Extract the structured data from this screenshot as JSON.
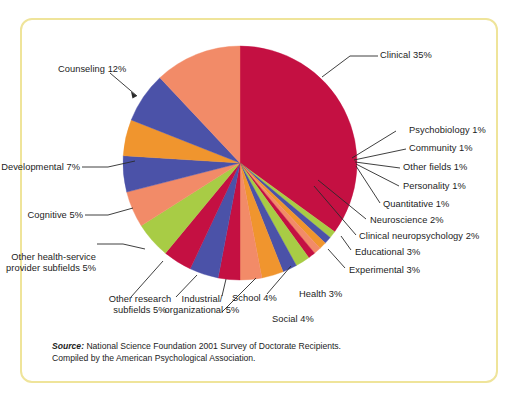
{
  "figure": {
    "border_color": "#EFE49A",
    "background": "#ffffff"
  },
  "source_note": {
    "label": "Source:",
    "line1": " National Science Foundation 2001 Survey of Doctorate Recipients.",
    "line2": "Compiled by the American Psychological Association."
  },
  "chart_data": {
    "type": "pie",
    "title": "",
    "xlabel": "",
    "ylabel": "",
    "legend_position": "callout-labels",
    "grid": false,
    "start_angle_deg": -90,
    "direction": "clockwise",
    "center": {
      "x": 240,
      "y": 163
    },
    "radius": 117,
    "categories": [
      "Clinical",
      "Psychobiology",
      "Community",
      "Other fields",
      "Personality",
      "Quantitative",
      "Neuroscience",
      "Clinical neuropsychology",
      "Educational",
      "Experimental",
      "Health",
      "Social",
      "School",
      "Industrial/organizational",
      "Other research subfields",
      "Other health-service provider subfields",
      "Cognitive",
      "Developmental",
      "Counseling"
    ],
    "values": [
      35,
      1,
      1,
      1,
      1,
      1,
      2,
      2,
      3,
      3,
      3,
      4,
      4,
      5,
      5,
      5,
      5,
      7,
      12
    ],
    "colors": [
      "#C41042",
      "#A8CC45",
      "#4B52A8",
      "#F0952E",
      "#F28B68",
      "#C41042",
      "#A8CC45",
      "#4B52A8",
      "#F0952E",
      "#F28B68",
      "#C41042",
      "#4B52A8",
      "#C41042",
      "#A8CC45",
      "#F28B68",
      "#4B52A8",
      "#F0952E",
      "#4B52A8",
      "#F28B68"
    ],
    "labels": [
      {
        "key": "clinical",
        "text": "Clinical 35%"
      },
      {
        "key": "psychobiology",
        "text": "Psychobiology 1%"
      },
      {
        "key": "community",
        "text": "Community 1%"
      },
      {
        "key": "other-fields",
        "text": "Other fields 1%"
      },
      {
        "key": "personality",
        "text": "Personality 1%"
      },
      {
        "key": "quantitative",
        "text": "Quantitative 1%"
      },
      {
        "key": "neuroscience",
        "text": "Neuroscience 2%"
      },
      {
        "key": "clinical-neuropsychology",
        "text": "Clinical neuropsychology 2%"
      },
      {
        "key": "educational",
        "text": "Educational 3%"
      },
      {
        "key": "experimental",
        "text": "Experimental 3%"
      },
      {
        "key": "health",
        "text": "Health 3%"
      },
      {
        "key": "social",
        "text": "Social 4%"
      },
      {
        "key": "school",
        "text": "School 4%"
      },
      {
        "key": "industrial-organizational",
        "text": "Industrial/\norganizational 5%"
      },
      {
        "key": "other-research-subfields",
        "text": "Other research\nsubfields 5%"
      },
      {
        "key": "other-health-service",
        "text": "Other health-service\nprovider subfields 5%"
      },
      {
        "key": "cognitive",
        "text": "Cognitive 5%"
      },
      {
        "key": "developmental",
        "text": "Developmental 7%"
      },
      {
        "key": "counseling",
        "text": "Counseling 12%"
      }
    ]
  },
  "label_text": {
    "clinical": "Clinical 35%",
    "psychobiology": "Psychobiology 1%",
    "community": "Community 1%",
    "other_fields": "Other fields 1%",
    "personality": "Personality 1%",
    "quantitative": "Quantitative 1%",
    "neuroscience": "Neuroscience 2%",
    "clinical_neuropsychology": "Clinical neuropsychology 2%",
    "educational": "Educational 3%",
    "experimental": "Experimental 3%",
    "health": "Health 3%",
    "social": "Social 4%",
    "school": "School 4%",
    "industrial_line1": "Industrial/",
    "industrial_line2": "organizational 5%",
    "other_research_line1": "Other research",
    "other_research_line2": "subfields 5%",
    "other_health_line1": "Other health-service",
    "other_health_line2": "provider subfields 5%",
    "cognitive": "Cognitive 5%",
    "developmental": "Developmental 7%",
    "counseling": "Counseling 12%"
  }
}
